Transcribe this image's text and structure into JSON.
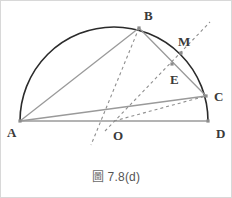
{
  "figure": {
    "caption_prefix": "圖",
    "caption_text": "7.8(d)",
    "caption_full": "圖 7.8(d)",
    "frame_color": "#d8d8d8",
    "background_color": "#ffffff",
    "arc_color": "#2b2b2b",
    "solid_line_color": "#9a9a9a",
    "dashed_line_color": "#8f8f8f",
    "point_marker_color": "#8c8c8c",
    "label_color": "#3a3a3a",
    "points": [
      {
        "name": "A",
        "x": 19,
        "y": 120,
        "label_dx": -13,
        "label_dy": 5,
        "marker": true
      },
      {
        "name": "B",
        "x": 138,
        "y": 27,
        "label_dx": 5,
        "label_dy": -19,
        "marker": true
      },
      {
        "name": "C",
        "x": 205,
        "y": 95,
        "label_dx": 8,
        "label_dy": -6,
        "marker": true
      },
      {
        "name": "D",
        "x": 207,
        "y": 120,
        "label_dx": 8,
        "label_dy": 6,
        "marker": true
      },
      {
        "name": "E",
        "x": 171,
        "y": 63,
        "label_dx": -2,
        "label_dy": 9,
        "marker": true
      },
      {
        "name": "M",
        "x": 180,
        "y": 52,
        "label_dx": -3,
        "label_dy": -18,
        "marker": true
      },
      {
        "name": "O",
        "x": 113,
        "y": 120,
        "label_dx": -1,
        "label_dy": 8,
        "marker": false
      }
    ],
    "semicircle": {
      "center_x": 113,
      "center_y": 120,
      "radius": 94,
      "start_point": "A",
      "end_point": "D",
      "stroke_width": 1.6
    },
    "solid_segments": [
      {
        "name": "segment-AD",
        "from": "A",
        "to": "D"
      },
      {
        "name": "segment-AB",
        "from": "A",
        "to": "B"
      },
      {
        "name": "segment-AC",
        "from": "A",
        "to": "C"
      },
      {
        "name": "segment-BC",
        "from": "B",
        "to": "C"
      }
    ],
    "dashed_segments": [
      {
        "name": "dashed-line-B-O-extended",
        "x1": 138,
        "y1": 27,
        "x2": 90,
        "y2": 144
      },
      {
        "name": "dashed-line-O-E-M-extended",
        "x1": 104,
        "y1": 130,
        "x2": 209,
        "y2": 21
      },
      {
        "name": "dashed-line-O-C",
        "x1": 113,
        "y1": 120,
        "x2": 205,
        "y2": 95
      }
    ]
  }
}
